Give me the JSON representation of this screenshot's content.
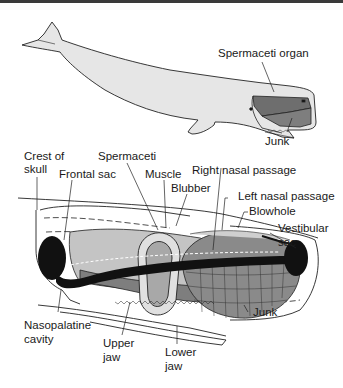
{
  "figure": {
    "top_panel": {
      "name": "Sperm whale full body",
      "labels": {
        "spermaceti_organ": "Spermaceti organ",
        "junk": "Junk"
      }
    },
    "bottom_panel": {
      "name": "Sperm whale head cross-section",
      "labels": {
        "crest_of_skull_1": "Crest of",
        "crest_of_skull_2": "skull",
        "frontal_sac": "Frontal sac",
        "spermaceti": "Spermaceti",
        "muscle": "Muscle",
        "blubber": "Blubber",
        "right_nasal_passage": "Right nasal passage",
        "left_nasal_passage": "Left nasal passage",
        "blowhole": "Blowhole",
        "vestibular_sac_1": "Vestibular",
        "vestibular_sac_2": "sac",
        "junk": "Junk",
        "nasopalatine_cavity_1": "Nasopalatine",
        "nasopalatine_cavity_2": "cavity",
        "upper_jaw_1": "Upper",
        "upper_jaw_2": "jaw",
        "lower_jaw_1": "Lower",
        "lower_jaw_2": "jaw"
      }
    },
    "colors": {
      "body_fill": "#e6e6e6",
      "organ_fill": "#7a7a7a",
      "light_organ_fill": "#c4c4c4",
      "dark_fill": "#111111",
      "line": "#222222"
    }
  }
}
